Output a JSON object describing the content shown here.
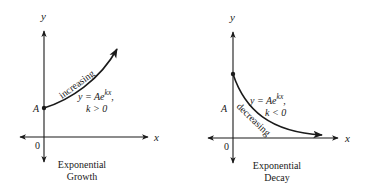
{
  "panels": [
    {
      "id": "growth",
      "axis_y_label": "y",
      "axis_x_label": "x",
      "origin_label": "0",
      "point_label": "A",
      "trend_label": "increasing",
      "equation_main": "y = Ae",
      "equation_exp": "kx",
      "equation_comma": ",",
      "condition": "k > 0",
      "caption_line1": "Exponential",
      "caption_line2": "Growth"
    },
    {
      "id": "decay",
      "axis_y_label": "y",
      "axis_x_label": "x",
      "origin_label": "0",
      "point_label": "A",
      "trend_label": "decreasing",
      "equation_main": "y = Ae",
      "equation_exp": "kx",
      "equation_comma": ",",
      "condition": "k < 0",
      "caption_line1": "Exponential",
      "caption_line2": "Decay"
    }
  ],
  "colors": {
    "ink": "#1a1a1a",
    "background": "#ffffff"
  }
}
